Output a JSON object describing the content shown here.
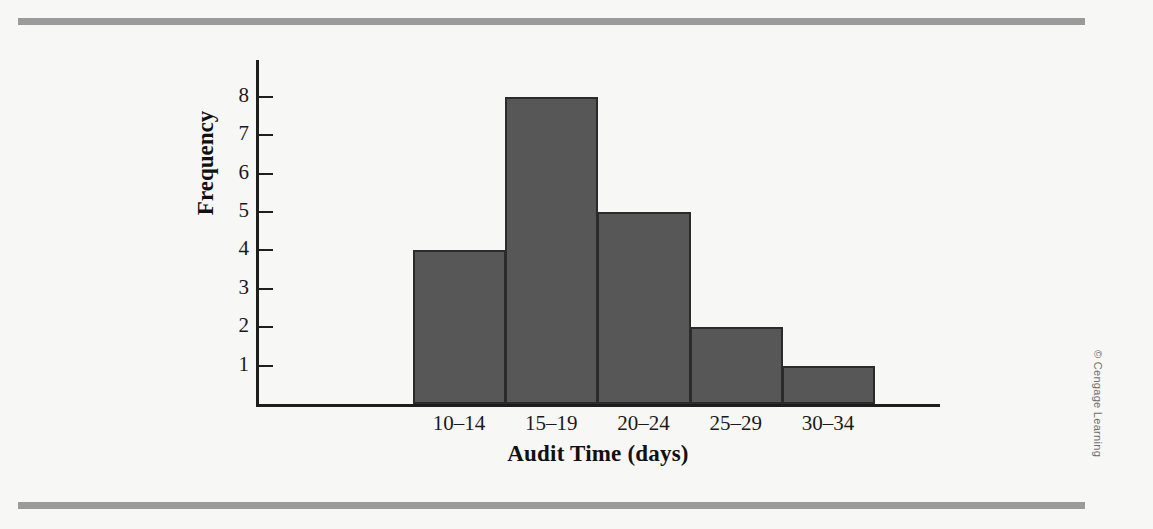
{
  "figure": {
    "background_color": "#f7f7f5",
    "rule_color": "#9b9b9b",
    "credit": "© Cengage Learning"
  },
  "chart_data": {
    "type": "bar",
    "title": "",
    "xlabel": "Audit Time (days)",
    "ylabel": "Frequency",
    "categories": [
      "10–14",
      "15–19",
      "20–24",
      "25–29",
      "30–34"
    ],
    "values": [
      4,
      8,
      5,
      2,
      1
    ],
    "ytick_labels": [
      "1",
      "2",
      "3",
      "4",
      "5",
      "6",
      "7",
      "8"
    ],
    "ytick_values": [
      1,
      2,
      3,
      4,
      5,
      6,
      7,
      8
    ],
    "ylim": [
      0,
      8.8
    ],
    "grid": false,
    "legend": "none",
    "bar_fill_color": "#575757",
    "bar_edge_color": "#2b2b2b",
    "axis_color": "#1e1e1e"
  }
}
